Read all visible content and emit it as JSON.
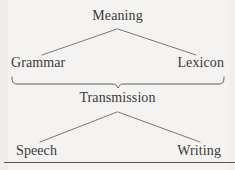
{
  "diagram": {
    "type": "tree",
    "nodes": {
      "meaning": "Meaning",
      "grammar": "Grammar",
      "lexicon": "Lexicon",
      "transmission": "Transmission",
      "speech": "Speech",
      "writing": "Writing"
    },
    "connectors": {
      "brace": "curly-brace-joining-grammar-and-lexicon",
      "upper_branch_left": "Meaning-to-Grammar",
      "upper_branch_right": "Meaning-to-Lexicon",
      "lower_branch_left": "Transmission-to-Speech",
      "lower_branch_right": "Transmission-to-Writing"
    },
    "colors": {
      "background": "#f4f3f1",
      "text": "#3b3a38",
      "line": "#6b6a68",
      "rule": "#565452"
    }
  }
}
